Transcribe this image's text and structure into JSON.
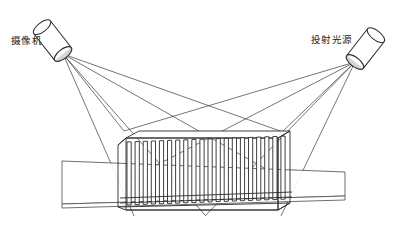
{
  "diagram": {
    "type": "line-diagram",
    "background": "#ffffff",
    "stroke_color": "#2b2b2b",
    "fill_color": "#ffffff",
    "labels": {
      "camera": "摄像机",
      "light_source": "投射光源"
    },
    "components": {
      "camera": {
        "name": "camera-cylinder",
        "label": "摄像机",
        "apex_x": 63,
        "apex_y": 54,
        "angle_deg": 52
      },
      "light_source": {
        "name": "light-source-cylinder",
        "label": "投射光源",
        "apex_x": 355,
        "apex_y": 62,
        "angle_deg": -52
      },
      "conveyor": {
        "name": "conveyor-slab",
        "left": 62,
        "right": 345,
        "top": 158,
        "bottom": 205
      },
      "workpiece": {
        "name": "finned-workpiece",
        "fin_count": 20,
        "left": 124,
        "right": 282,
        "top": 131,
        "bottom": 215
      }
    },
    "rays": {
      "camera_ray_count": 5,
      "light_ray_count": 5,
      "arrow_direction_camera": "toward-camera",
      "arrow_direction_light": "toward-light-source"
    }
  }
}
